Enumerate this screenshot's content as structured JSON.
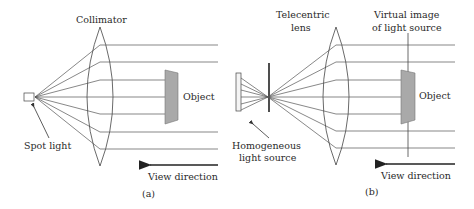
{
  "figure": {
    "panel_a": {
      "caption": "(a)",
      "labels": {
        "lens": "Collimator",
        "source": "Spot light",
        "object": "Object",
        "view": "View direction"
      }
    },
    "panel_b": {
      "caption": "(b)",
      "labels": {
        "lens_line1": "Telecentric",
        "lens_line2": "lens",
        "virtual_line1": "Virtual image",
        "virtual_line2": "of light source",
        "source_line1": "Homogeneous",
        "source_line2": "light source",
        "object": "Object",
        "view": "View direction"
      }
    },
    "colors": {
      "line": "#555555",
      "object_fill": "#a9a9a9",
      "text": "#2a2a2a"
    }
  }
}
